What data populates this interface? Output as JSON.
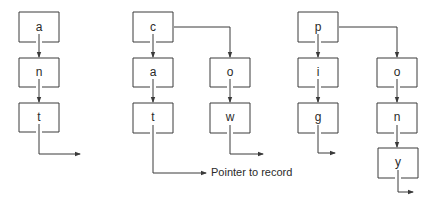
{
  "diagram": {
    "type": "trie",
    "stroke_color": "#3a3a3a",
    "background": "#ffffff",
    "caption": "Pointer to record",
    "tries": [
      {
        "word": "ant",
        "nodes": [
          {
            "id": "t1-a",
            "label": "a",
            "x": 19,
            "y": 12
          },
          {
            "id": "t1-n",
            "label": "n",
            "x": 19,
            "y": 58
          },
          {
            "id": "t1-t",
            "label": "t",
            "x": 19,
            "y": 103
          }
        ]
      },
      {
        "words": [
          "cat",
          "cow"
        ],
        "nodes": [
          {
            "id": "t2-c",
            "label": "c",
            "x": 133,
            "y": 12
          },
          {
            "id": "t2-a",
            "label": "a",
            "x": 133,
            "y": 58
          },
          {
            "id": "t2-t",
            "label": "t",
            "x": 133,
            "y": 103
          },
          {
            "id": "t2-o",
            "label": "o",
            "x": 210,
            "y": 58
          },
          {
            "id": "t2-w",
            "label": "w",
            "x": 210,
            "y": 103
          }
        ]
      },
      {
        "words": [
          "pig",
          "pony"
        ],
        "nodes": [
          {
            "id": "t3-p",
            "label": "p",
            "x": 298,
            "y": 12
          },
          {
            "id": "t3-i",
            "label": "i",
            "x": 298,
            "y": 58
          },
          {
            "id": "t3-g",
            "label": "g",
            "x": 298,
            "y": 103
          },
          {
            "id": "t3-o",
            "label": "o",
            "x": 377,
            "y": 58
          },
          {
            "id": "t3-n",
            "label": "n",
            "x": 377,
            "y": 103
          },
          {
            "id": "t3-y",
            "label": "y",
            "x": 378,
            "y": 148
          }
        ]
      }
    ]
  }
}
